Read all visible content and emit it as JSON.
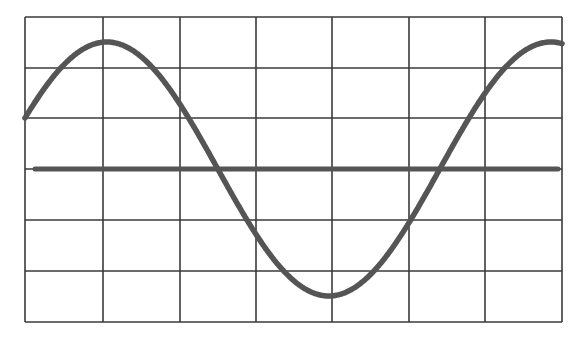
{
  "diagram": {
    "type": "oscilloscope-waveform",
    "grid": {
      "columns": 7,
      "rows": 6,
      "x_lines": [
        25,
        103,
        180,
        256,
        332,
        409,
        485,
        562
      ],
      "y_lines": [
        17,
        68,
        118,
        169,
        220,
        271,
        322
      ],
      "line_color": "#3a3a3a"
    },
    "axis_line": {
      "y": 169,
      "x1": 35,
      "x2": 558,
      "color": "#555555",
      "width": 5
    },
    "waveform": {
      "shape": "sine",
      "color": "#555555",
      "width": 5.5,
      "points": [
        [
          25,
          118
        ],
        [
          115,
          41
        ],
        [
          226,
          169
        ],
        [
          336,
          296
        ],
        [
          448,
          169
        ],
        [
          562,
          42
        ]
      ],
      "amplitude_divisions": 2.5,
      "center_y": 169,
      "amplitude_px": 127,
      "period_px": 444,
      "start_phase_y": 118
    }
  }
}
